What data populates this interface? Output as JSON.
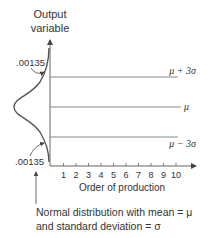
{
  "y_axis": {
    "label_line1": "Output",
    "label_line2": "variable"
  },
  "x_axis": {
    "label": "Order of production",
    "ticks": [
      "1",
      "2",
      "3",
      "4",
      "5",
      "6",
      "7",
      "8",
      "9",
      "10"
    ]
  },
  "control_lines": {
    "upper": "μ + 3σ",
    "center": "μ",
    "lower": "μ − 3σ"
  },
  "tail_probability": {
    "upper": ".00135",
    "lower": ".00135"
  },
  "caption": {
    "line1": "Normal distribution  with  mean = μ",
    "line2": "and standard deviation = σ"
  },
  "colors": {
    "line": "#555555",
    "text": "#333333",
    "control": "#888888"
  }
}
